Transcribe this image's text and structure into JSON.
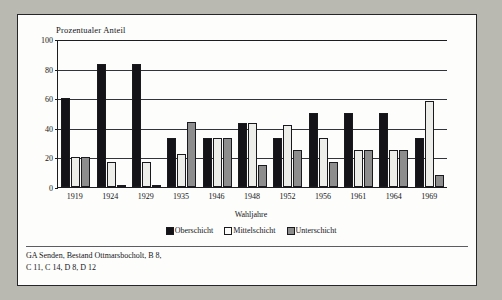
{
  "figure": {
    "y_axis_title": "Prozentualer Anteil",
    "x_axis_title": "Wahljahre",
    "source_line1": "GA Senden, Bestand Ottmarsbocholt, B 8,",
    "source_line2": "C 11, C 14, D 8, D 12"
  },
  "colors": {
    "oberschicht": "#141418",
    "mittelschicht": "#ededea",
    "unterschicht": "#8d8d8d",
    "axis": "#1d1d21",
    "paper": "#fdfdfb",
    "page": "#b9b9b2"
  },
  "chart_data": {
    "type": "bar",
    "title": "",
    "xlabel": "Wahljahre",
    "ylabel": "Prozentualer Anteil",
    "ylim": [
      0,
      100
    ],
    "yticks": [
      0,
      20,
      40,
      60,
      80,
      100
    ],
    "grid": true,
    "legend_position": "bottom",
    "categories": [
      "1919",
      "1924",
      "1929",
      "1935",
      "1946",
      "1948",
      "1952",
      "1956",
      "1961",
      "1964",
      "1969"
    ],
    "series": [
      {
        "name": "Oberschicht",
        "values": [
          60,
          83,
          83,
          33,
          33,
          43,
          33,
          50,
          50,
          50,
          33
        ]
      },
      {
        "name": "Mittelschicht",
        "values": [
          20,
          17,
          17,
          22,
          33,
          43,
          42,
          33,
          25,
          25,
          58
        ]
      },
      {
        "name": "Unterschicht",
        "values": [
          20,
          0,
          0,
          44,
          33,
          15,
          25,
          17,
          25,
          25,
          8
        ]
      }
    ]
  }
}
